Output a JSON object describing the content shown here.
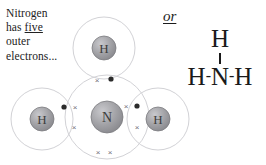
{
  "caption": {
    "line1": "Nitrogen",
    "line2_pre": "has ",
    "line2_em": "five",
    "line3": "outer",
    "line4": "electrons..."
  },
  "alternative": {
    "or_label": "or"
  },
  "structural_formula": {
    "top_atom": "H",
    "left_atom": "H",
    "center_atom": "N",
    "right_atom": "H",
    "bond_glyph": "-",
    "full_text": "H-N-H"
  },
  "diagram": {
    "molecule": "ammonia",
    "formula": "NH3",
    "style": "dot-and-cross",
    "center_atom": {
      "symbol": "N",
      "name": "nitrogen",
      "cx": 107,
      "cy": 117,
      "nucleus_r": 16,
      "shell_r": 42
    },
    "hydrogens": [
      {
        "symbol": "H",
        "position": "top",
        "cx": 104,
        "cy": 48,
        "nucleus_r": 12,
        "shell_r": 31
      },
      {
        "symbol": "H",
        "position": "left",
        "cx": 42,
        "cy": 119,
        "nucleus_r": 12,
        "shell_r": 31
      },
      {
        "symbol": "H",
        "position": "right",
        "cx": 158,
        "cy": 119,
        "nucleus_r": 12,
        "shell_r": 31
      }
    ],
    "bonding_pairs": [
      {
        "bond": "N-H-top",
        "cross": {
          "x": 97,
          "y": 80,
          "glyph": "×"
        },
        "dot": {
          "x": 111,
          "y": 79,
          "r": 2.6
        }
      },
      {
        "bond": "N-H-left",
        "cross": {
          "x": 74,
          "y": 127,
          "glyph": "×"
        },
        "dot": {
          "x": 64,
          "y": 107,
          "r": 2.6
        }
      },
      {
        "bond": "N-H-right",
        "cross": {
          "x": 137,
          "y": 127,
          "glyph": "×"
        },
        "dot": {
          "x": 137,
          "y": 106,
          "r": 2.6
        }
      }
    ],
    "nitrogen_own_electrons": [
      {
        "x": 75,
        "y": 107,
        "glyph": "×"
      },
      {
        "x": 126,
        "y": 106,
        "glyph": "×"
      }
    ],
    "lone_pair": [
      {
        "x": 98,
        "y": 152,
        "glyph": "×"
      },
      {
        "x": 110,
        "y": 152,
        "glyph": "×"
      }
    ],
    "colors": {
      "shell_stroke": "#d2d2d6",
      "nucleus_fill": "#9a9a9e",
      "nucleus_stroke": "#7c7c80",
      "label_fill": "#3d3d3d",
      "cross_fill": "#6f6f78",
      "dot_fill": "#2b2b2b",
      "text": "#222222",
      "background": "#ffffff"
    }
  }
}
